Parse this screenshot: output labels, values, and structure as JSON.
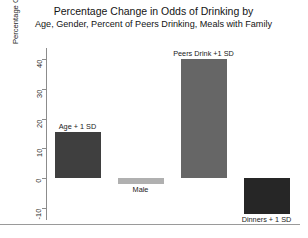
{
  "chart_data": {
    "type": "bar",
    "title": "Percentage Change in Odds of Drinking by",
    "subtitle": "Age, Gender, Percent of Peers Drinking, Meals with Family",
    "xlabel": "",
    "ylabel": "Percentage Change in Odds",
    "ylim": [
      -14,
      43
    ],
    "yticks": [
      40,
      30,
      20,
      10,
      0,
      -10
    ],
    "ytick_labels": [
      "40",
      "30",
      "20",
      "10",
      "0",
      "-10"
    ],
    "grid": false,
    "legend": "none",
    "categories": [
      "Age + 1 SD",
      "Male",
      "Peers Drink +1 SD",
      "Dinners + 1 SD"
    ],
    "values": [
      15.5,
      -2,
      40,
      -12
    ],
    "bar_colors": [
      "#3f3f3f",
      "#b0b0b0",
      "#666666",
      "#262626"
    ],
    "annotations": [
      {
        "label": "Age + 1 SD",
        "value": 15.5,
        "position": "above"
      },
      {
        "label": "Male",
        "value": -2,
        "position": "below"
      },
      {
        "label": "Peers Drink +1 SD",
        "value": 40,
        "position": "above"
      },
      {
        "label": "Dinners + 1 SD",
        "value": -12,
        "position": "below"
      }
    ]
  },
  "figure": {
    "background": "#ffffff",
    "axis_color": "#8c8c8c",
    "text_color": "#1a1a1a"
  }
}
